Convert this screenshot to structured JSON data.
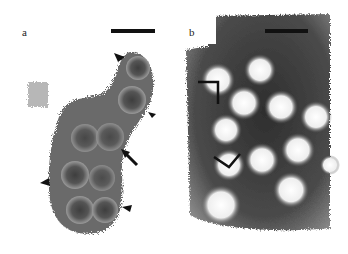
{
  "figure": {
    "panels": [
      {
        "id": "a",
        "label": "a",
        "description": "Grey cluster of particles with dark cores and grainy halos; arrowheads and one arrow mark individual particles",
        "scale_bar": true,
        "markers": {
          "arrowheads": 5,
          "arrows": 1
        }
      },
      {
        "id": "b",
        "label": "b",
        "description": "Dark negative-stain background with bright round particles; two black angle brackets mark particles",
        "scale_bar": true,
        "markers": {
          "brackets": 2
        }
      }
    ],
    "colors": {
      "background": "#ffffff",
      "panel_a_body": "#5a5a5a",
      "panel_a_halo": "#9a9a9a",
      "panel_b_background": "#4a4a4a",
      "panel_b_particle": "#f4f4f4",
      "marker": "#111111"
    }
  }
}
